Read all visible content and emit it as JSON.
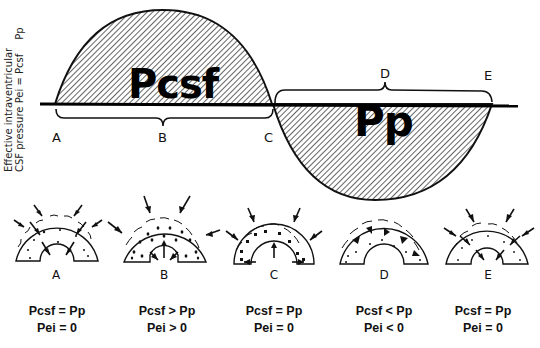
{
  "axis": {
    "label_line1": "Effective intraventricular",
    "label_line2": "CSF pressure Pei = Pcsf",
    "label_pp": "Pp"
  },
  "curve": {
    "upper_region_label": "Pcsf",
    "lower_region_label": "Pp"
  },
  "points": {
    "A": "A",
    "B": "B",
    "C": "C",
    "D": "D",
    "E": "E"
  },
  "stages": [
    {
      "label": "A",
      "line1": "Pcsf = Pp",
      "line2": "Pei = 0"
    },
    {
      "label": "B",
      "line1": "Pcsf > Pp",
      "line2": "Pei > 0"
    },
    {
      "label": "C",
      "line1": "Pcsf = Pp",
      "line2": "Pei = 0"
    },
    {
      "label": "D",
      "line1": "Pcsf < Pp",
      "line2": "Pei < 0"
    },
    {
      "label": "E",
      "line1": "Pcsf = Pp",
      "line2": "Pei = 0"
    }
  ],
  "colors": {
    "ink": "#111111",
    "background": "#ffffff"
  }
}
